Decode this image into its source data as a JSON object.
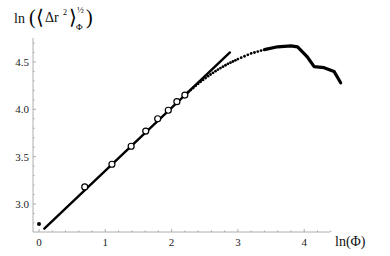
{
  "chart_data": {
    "type": "scatter",
    "title": "",
    "xlabel": "ln(Φ)",
    "ylabel": "ln(⟨Δr²⟩_Φ^½)",
    "ylabel_parts": {
      "prefix": "ln",
      "inner": "Δr",
      "sup": "2",
      "exp": "½",
      "sub": "Φ"
    },
    "xlim": [
      0,
      4.6
    ],
    "ylim": [
      2.72,
      4.7
    ],
    "xticks": [
      "0",
      "1",
      "2",
      "3",
      "4"
    ],
    "xtick_values": [
      0,
      1,
      2,
      3,
      4
    ],
    "yticks": [
      "3.0",
      "3.5",
      "4.0",
      "4.5"
    ],
    "ytick_values": [
      3.0,
      3.5,
      4.0,
      4.5
    ],
    "grid": false,
    "series": [
      {
        "name": "initial point",
        "style": "filled-dot",
        "x": [
          0
        ],
        "y": [
          2.79
        ]
      },
      {
        "name": "open circles",
        "style": "open-circle",
        "x": [
          0.69,
          1.1,
          1.39,
          1.61,
          1.79,
          1.95,
          2.08,
          2.2
        ],
        "y": [
          3.18,
          3.42,
          3.61,
          3.77,
          3.9,
          3.99,
          4.08,
          4.15
        ]
      },
      {
        "name": "linear fit",
        "style": "line",
        "x": [
          0.08,
          2.88
        ],
        "y": [
          2.74,
          4.6
        ]
      },
      {
        "name": "dotted data",
        "style": "dots",
        "x": [
          2.25,
          2.4,
          2.55,
          2.7,
          2.85,
          3.0,
          3.2,
          3.4
        ],
        "y": [
          4.18,
          4.27,
          4.35,
          4.42,
          4.48,
          4.53,
          4.59,
          4.63
        ]
      },
      {
        "name": "curve",
        "style": "thick-line",
        "x": [
          3.4,
          3.6,
          3.8,
          3.9,
          4.05,
          4.15,
          4.3,
          4.45,
          4.55
        ],
        "y": [
          4.63,
          4.66,
          4.67,
          4.66,
          4.55,
          4.45,
          4.44,
          4.4,
          4.28
        ]
      }
    ]
  }
}
